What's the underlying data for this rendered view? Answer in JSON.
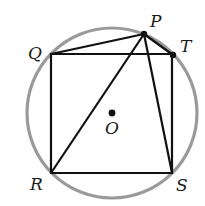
{
  "diagram": {
    "type": "geometry",
    "colors": {
      "circle": "#9a9a9a",
      "lines": "#111111",
      "points": "#111111",
      "background": "#ffffff"
    },
    "circle": {
      "center": "O",
      "cx": 112,
      "cy": 113,
      "r": 85
    },
    "points": {
      "P": {
        "x": 144,
        "y": 34,
        "label": "P",
        "lx": 150,
        "ly": 27,
        "dot": true
      },
      "Q": {
        "x": 51,
        "y": 54,
        "label": "Q",
        "lx": 29,
        "ly": 58,
        "dot": false
      },
      "T": {
        "x": 173,
        "y": 55,
        "label": "T",
        "lx": 180,
        "ly": 52,
        "dot": true
      },
      "R": {
        "x": 51,
        "y": 173,
        "label": "R",
        "lx": 30,
        "ly": 189,
        "dot": false
      },
      "S": {
        "x": 172,
        "y": 173,
        "label": "S",
        "lx": 176,
        "ly": 191,
        "dot": false
      },
      "O": {
        "x": 112,
        "y": 113,
        "label": "O",
        "lx": 105,
        "ly": 134,
        "dot": true
      }
    },
    "square": [
      "Q",
      "T",
      "S",
      "R"
    ],
    "segments": [
      [
        "P",
        "Q"
      ],
      [
        "P",
        "T"
      ],
      [
        "P",
        "R"
      ],
      [
        "P",
        "S"
      ]
    ],
    "labels": {
      "P": "P",
      "Q": "Q",
      "T": "T",
      "R": "R",
      "S": "S",
      "O": "O"
    }
  }
}
